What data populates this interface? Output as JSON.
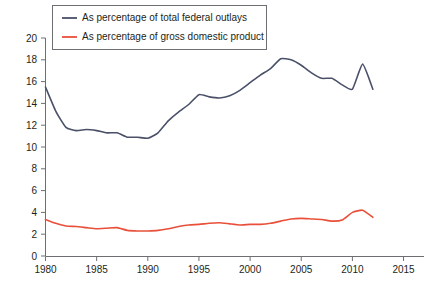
{
  "chart_data": {
    "type": "line",
    "title": "",
    "xlabel": "",
    "ylabel": "",
    "xlim": [
      1980,
      2017
    ],
    "ylim": [
      0,
      20
    ],
    "grid": false,
    "legend_position": "top-left",
    "x_ticks": [
      "1980",
      "1985",
      "1990",
      "1995",
      "2000",
      "2005",
      "2010",
      "2015"
    ],
    "x_tick_values": [
      1980,
      1985,
      1990,
      1995,
      2000,
      2005,
      2010,
      2015
    ],
    "y_ticks": [
      "0",
      "2",
      "4",
      "6",
      "8",
      "10",
      "12",
      "14",
      "16",
      "18",
      "20"
    ],
    "y_tick_values": [
      0,
      2,
      4,
      6,
      8,
      10,
      12,
      14,
      16,
      18,
      20
    ],
    "x": [
      1980,
      1981,
      1982,
      1983,
      1984,
      1985,
      1986,
      1987,
      1988,
      1989,
      1990,
      1991,
      1992,
      1993,
      1994,
      1995,
      1996,
      1997,
      1998,
      1999,
      2000,
      2001,
      2002,
      2003,
      2004,
      2005,
      2006,
      2007,
      2008,
      2009,
      2010,
      2011,
      2012
    ],
    "series": [
      {
        "name": "As percentage of total federal outlays",
        "color": "#4a5068",
        "values": [
          15.5,
          13.3,
          11.8,
          11.5,
          11.6,
          11.5,
          11.3,
          11.3,
          10.9,
          10.9,
          10.8,
          11.3,
          12.4,
          13.2,
          13.9,
          14.8,
          14.6,
          14.5,
          14.7,
          15.2,
          15.9,
          16.6,
          17.2,
          18.1,
          18.0,
          17.5,
          16.8,
          16.3,
          16.3,
          15.7,
          15.3,
          17.6,
          15.3
        ]
      },
      {
        "name": "As percentage of gross domestic product",
        "color": "#e8503a",
        "values": [
          3.35,
          3.0,
          2.75,
          2.7,
          2.6,
          2.5,
          2.55,
          2.6,
          2.35,
          2.3,
          2.3,
          2.35,
          2.5,
          2.7,
          2.85,
          2.9,
          3.0,
          3.05,
          2.95,
          2.85,
          2.9,
          2.9,
          3.0,
          3.2,
          3.4,
          3.45,
          3.4,
          3.35,
          3.2,
          3.3,
          4.0,
          4.2,
          3.55
        ]
      }
    ]
  },
  "legend": {
    "items": [
      {
        "label": "As percentage of total federal outlays",
        "color": "#4a5068"
      },
      {
        "label": "As percentage of gross domestic product",
        "color": "#e8503a"
      }
    ]
  }
}
